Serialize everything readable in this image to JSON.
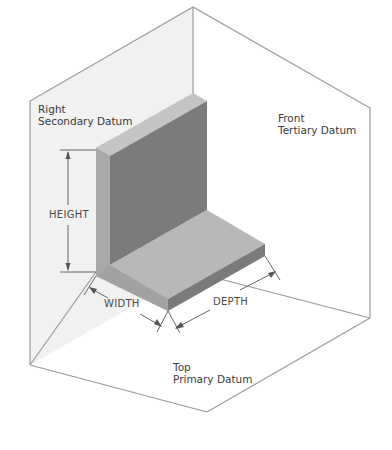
{
  "diagram": {
    "type": "isometric datum reference frame",
    "planes": {
      "right": {
        "title": "Right",
        "subtitle": "Secondary Datum"
      },
      "front": {
        "title": "Front",
        "subtitle": "Tertiary Datum"
      },
      "top": {
        "title": "Top",
        "subtitle": "Primary Datum"
      }
    },
    "dimensions": {
      "height": "HEIGHT",
      "width": "WIDTH",
      "depth": "DEPTH"
    },
    "colors": {
      "plane_line": "#9a9a9a",
      "right_plane_fill": "#f1f1f1",
      "solid_top": "#bdbdbd",
      "solid_front_dark": "#7d7d7d",
      "solid_side_light": "#a8a8a8",
      "base_top": "#b9b9b9",
      "dim_line": "#555555"
    }
  }
}
